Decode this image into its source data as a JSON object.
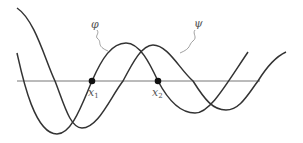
{
  "diagram": {
    "curves": [
      {
        "name": "phi",
        "label": "φ",
        "color": "#333333"
      },
      {
        "name": "psi",
        "label": "ψ",
        "color": "#333333"
      }
    ],
    "points": [
      {
        "label": "x",
        "subscript": "1"
      },
      {
        "label": "x",
        "subscript": "2"
      }
    ],
    "axis_color": "#777777",
    "point_color": "#111111"
  }
}
